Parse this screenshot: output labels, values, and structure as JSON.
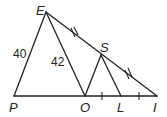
{
  "diagram": {
    "points": {
      "E": {
        "label": "E",
        "x": 46,
        "y": 12
      },
      "P": {
        "label": "P",
        "x": 14,
        "y": 96
      },
      "O": {
        "label": "O",
        "x": 85,
        "y": 96
      },
      "L": {
        "label": "L",
        "x": 121,
        "y": 96
      },
      "I": {
        "label": "I",
        "x": 157,
        "y": 96
      },
      "S": {
        "label": "S",
        "x": 101,
        "y": 55
      }
    },
    "segments": [
      [
        "E",
        "P"
      ],
      [
        "E",
        "O"
      ],
      [
        "E",
        "I"
      ],
      [
        "P",
        "I"
      ],
      [
        "S",
        "O"
      ],
      [
        "S",
        "L"
      ]
    ],
    "lengths": {
      "EP": "40",
      "EO": "42"
    },
    "congruence_marks": {
      "double_ticks": [
        "ES",
        "SI"
      ],
      "single_ticks": [
        "OL",
        "LI"
      ]
    }
  }
}
